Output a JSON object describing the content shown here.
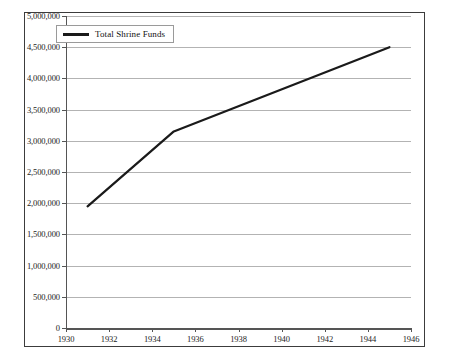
{
  "chart_data": {
    "type": "line",
    "title": "",
    "subtitle": "",
    "xlabel": "",
    "ylabel": "",
    "grid": true,
    "legend_position": "top-left-inside",
    "xlim": [
      1930,
      1946
    ],
    "ylim": [
      0,
      5000000
    ],
    "x_ticks": [
      1930,
      1932,
      1934,
      1936,
      1938,
      1940,
      1942,
      1944,
      1946
    ],
    "x_tick_labels": [
      "1930",
      "1932",
      "1934",
      "1936",
      "1938",
      "1940",
      "1942",
      "1944",
      "1946"
    ],
    "y_ticks": [
      0,
      500000,
      1000000,
      1500000,
      2000000,
      2500000,
      3000000,
      3500000,
      4000000,
      4500000,
      5000000
    ],
    "y_tick_labels": [
      "0",
      "500,000",
      "1,000,000",
      "1,500,000",
      "2,000,000",
      "2,500,000",
      "3,000,000",
      "3,500,000",
      "4,000,000",
      "4,500,000",
      "5,000,000"
    ],
    "series": [
      {
        "name": "Total Shrine Funds",
        "color": "#1a1a1a",
        "line_width": 2.2,
        "x": [
          1931,
          1935,
          1945
        ],
        "values": [
          1950000,
          3150000,
          4500000
        ]
      }
    ]
  },
  "legend": {
    "entries": [
      {
        "label": "Total Shrine Funds",
        "color": "#1a1a1a"
      }
    ]
  },
  "colors": {
    "series_line": "#1a1a1a",
    "gridline": "#b3b3b3",
    "axis": "#555555",
    "frame_border": "#3c3c3c",
    "background": "#ffffff",
    "tick_label": "#1c1c1c"
  }
}
